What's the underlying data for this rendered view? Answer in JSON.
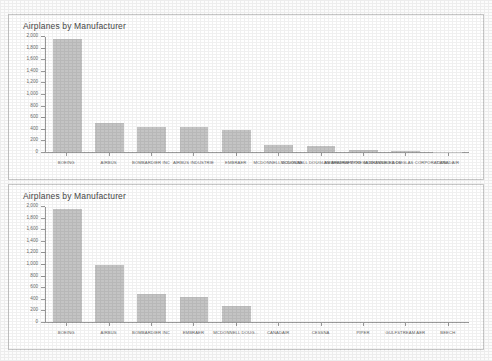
{
  "page": {
    "background_color": "#fcfcfc",
    "panel_border_color": "#c8c8c8",
    "bar_color": "#c4c4c4",
    "axis_color": "#9a9a9a",
    "text_color": "#5f5f5f"
  },
  "chart_data": [
    {
      "id": "chart-top",
      "type": "bar",
      "title": "Airplanes by Manufacturer",
      "xlabel": "",
      "ylabel": "",
      "ylim": [
        0,
        2000
      ],
      "grid": false,
      "legend": false,
      "yticks": [
        0,
        200,
        400,
        600,
        800,
        1000,
        1200,
        1400,
        1600,
        1800,
        2000
      ],
      "ytick_labels": [
        "0",
        "200",
        "400",
        "600",
        "800",
        "1,000",
        "1,200",
        "1,400",
        "1,600",
        "1,800",
        "2,000"
      ],
      "categories": [
        "BOEING",
        "AIRBUS",
        "BOMBARDIER INC",
        "AIRBUS INDUSTRIE",
        "EMBRAER",
        "MCDONNELL DOUGLAS",
        "MCDONNELL DOUGLAS AIRCRAFT CO",
        "EMBRAER EMPRESA BRASILEIRA DE",
        "MCDONNELL DOUGLAS CORPORATION",
        "CANADAIR"
      ],
      "values": [
        1960,
        510,
        440,
        430,
        390,
        120,
        110,
        40,
        12,
        6
      ]
    },
    {
      "id": "chart-bottom",
      "type": "bar",
      "title": "Airplanes by Manufacturer",
      "xlabel": "",
      "ylabel": "",
      "ylim": [
        0,
        2000
      ],
      "grid": false,
      "legend": false,
      "yticks": [
        0,
        200,
        400,
        600,
        800,
        1000,
        1200,
        1400,
        1600,
        1800,
        2000
      ],
      "ytick_labels": [
        "0",
        "200",
        "400",
        "600",
        "800",
        "1,000",
        "1,200",
        "1,400",
        "1,600",
        "1,800",
        "2,000"
      ],
      "categories": [
        "BOEING",
        "AIRBUS",
        "BOMBARDIER INC",
        "EMBRAER",
        "MCDONNELL DOUG...",
        "CANADAIR",
        "CESSNA",
        "PIPER",
        "GULFSTREAM AER",
        "BEECH"
      ],
      "values": [
        1960,
        1000,
        480,
        440,
        270,
        0,
        0,
        0,
        0,
        0
      ]
    }
  ]
}
